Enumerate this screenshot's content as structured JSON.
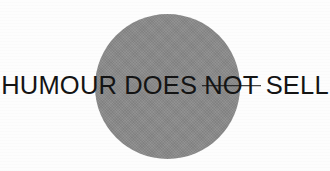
{
  "image": {
    "width": 330,
    "height": 171,
    "background_color": "#fdfdfd"
  },
  "shape": {
    "name": "gray-circle",
    "type": "circle",
    "color": "#8a8a8a",
    "center_x": 167,
    "center_y": 87,
    "diameter": 145
  },
  "headline": {
    "full_text": "HUMOUR DOES NOT SELL",
    "text_color": "#141414",
    "words": [
      {
        "text": "HUMOUR",
        "struck_through": false
      },
      {
        "text": "DOES",
        "struck_through": false
      },
      {
        "text": "NOT",
        "struck_through": true
      },
      {
        "text": "SELL",
        "struck_through": false
      }
    ],
    "word_1": "HUMOUR",
    "word_2": "DOES",
    "word_3": "NOT",
    "word_4": "SELL"
  }
}
